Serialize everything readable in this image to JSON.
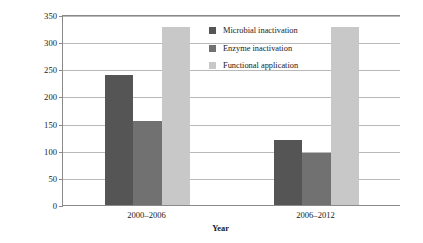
{
  "chart_data": {
    "type": "bar",
    "title": "",
    "xlabel": "Year",
    "ylabel": "Growth in the number of articles (%)",
    "categories": [
      "2000–2006",
      "2006–2012"
    ],
    "series": [
      {
        "name": "Microbial inactivation",
        "color": "#555555",
        "values": [
          240,
          120
        ]
      },
      {
        "name": "Enzyme inactivation",
        "color": "#717171",
        "values": [
          155,
          95
        ]
      },
      {
        "name": "Functional application",
        "color": "#c8c8c8",
        "values": [
          328,
          328
        ]
      }
    ],
    "ylim": [
      0,
      350
    ],
    "yticks": [
      0,
      50,
      100,
      150,
      200,
      250,
      300,
      350
    ],
    "ytick_labels": [
      "0",
      "50",
      "100",
      "150",
      "200",
      "250",
      "300",
      "350"
    ],
    "grid": true,
    "legend_position": "inside-top-center"
  }
}
